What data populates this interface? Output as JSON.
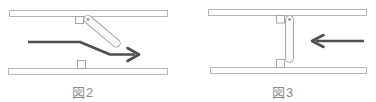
{
  "diagram": {
    "type": "check-valve-mechanism",
    "figures": [
      {
        "label": "図2",
        "valve_state": "open",
        "flap_orientation": "tilted-down-right",
        "flow_direction": "right",
        "parts": [
          "top-plate",
          "bottom-plate",
          "stopper-notch-top",
          "stopper-notch-bottom",
          "valve-flap",
          "pivot",
          "flow-arrow"
        ]
      },
      {
        "label": "図3",
        "valve_state": "closed",
        "flap_orientation": "vertical",
        "flow_direction": "left",
        "parts": [
          "top-plate",
          "bottom-plate",
          "stopper-notch-top",
          "stopper-notch-bottom",
          "valve-flap",
          "pivot",
          "flow-arrow"
        ]
      }
    ]
  },
  "colors": {
    "outline": "#b5b5b5",
    "outline_dark": "#a5a5a5",
    "arrow": "#4f4f4f",
    "label": "#8c8c8c",
    "fill": "#ffffff",
    "flap_fill": "#fbfbfb",
    "pivot": "#9a9a9a"
  }
}
